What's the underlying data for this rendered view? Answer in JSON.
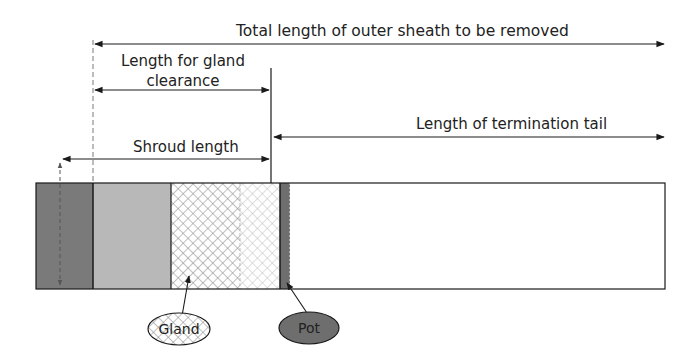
{
  "labels": {
    "total_length": "Total length of outer sheath to be removed",
    "gland_clearance_line1": "Length for gland",
    "gland_clearance_line2": "clearance",
    "termination_tail": "Length of termination tail",
    "shroud_length": "Shroud length",
    "gland": "Gland",
    "pot": "Pot"
  },
  "colors": {
    "line": "#1a1a1a",
    "dark_grey": "#7a7a7a",
    "light_grey": "#b8b8b8",
    "crosshatch": "#8c8c8c",
    "pot": "#6e6e6e",
    "background": "#ffffff"
  },
  "cable_segments": [
    {
      "name": "outer-sheath-end",
      "x_start": 36,
      "x_end": 93,
      "fill": "dark_grey"
    },
    {
      "name": "sheath-light",
      "x_start": 93,
      "x_end": 171,
      "fill": "light_grey"
    },
    {
      "name": "gland-body",
      "x_start": 171,
      "x_end": 280,
      "fill": "crosshatch"
    },
    {
      "name": "pot",
      "x_start": 280,
      "x_end": 290,
      "fill": "pot"
    },
    {
      "name": "termination-tail",
      "x_start": 290,
      "x_end": 665,
      "fill": "white"
    }
  ]
}
